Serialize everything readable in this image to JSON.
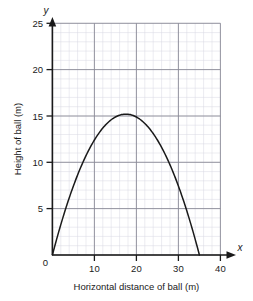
{
  "chart_data": {
    "type": "line",
    "title": "",
    "subtitle": "",
    "xlabel": "Horizontal distance of ball (m)",
    "ylabel": "Height of  ball (m)",
    "x_axis_name": "x",
    "y_axis_name": "y",
    "xlim": [
      0,
      40
    ],
    "ylim": [
      0,
      25
    ],
    "x_ticks": [
      0,
      10,
      20,
      30,
      40
    ],
    "x_tick_labels": [
      "0",
      "10",
      "20",
      "30",
      "40"
    ],
    "y_ticks": [
      0,
      5,
      10,
      15,
      20,
      25
    ],
    "y_tick_labels": [
      "0",
      "5",
      "10",
      "15",
      "20",
      "25"
    ],
    "grid": true,
    "grid_major_step_x": 10,
    "grid_major_step_y": 5,
    "grid_minor_step_x": 2,
    "grid_minor_step_y": 1,
    "legend": "none",
    "series": [
      {
        "name": "Path of ball",
        "color": "#1a1a1a",
        "x": [
          0,
          1,
          2,
          3,
          4,
          5,
          6,
          7,
          8,
          9,
          10,
          11,
          12,
          13,
          14,
          15,
          16,
          17,
          17.5,
          18,
          19,
          20,
          21,
          22,
          23,
          24,
          25,
          26,
          27,
          28,
          29,
          30,
          31,
          32,
          33,
          34,
          35
        ],
        "y": [
          0,
          1.68,
          3.25,
          4.71,
          6.05,
          7.29,
          8.41,
          9.43,
          10.33,
          11.12,
          11.8,
          12.37,
          12.83,
          13.18,
          13.41,
          13.54,
          13.55,
          13.46,
          13.37,
          13.25,
          12.93,
          12.49,
          11.95,
          11.29,
          10.52,
          9.64,
          8.65,
          7.54,
          6.33,
          5.0,
          3.56,
          2.01,
          0.35,
          0,
          0,
          0,
          0
        ]
      }
    ],
    "annotations": {
      "peak_x": 17.5,
      "peak_y": 15.2,
      "launch_x": 0,
      "landing_x": 35
    }
  }
}
